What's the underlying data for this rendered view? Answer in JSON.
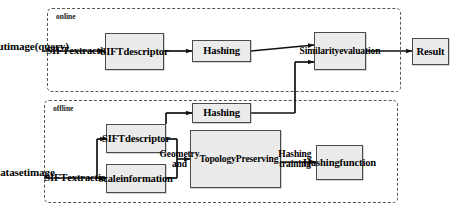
{
  "diagram": {
    "zones": [
      {
        "id": "online",
        "label": "online",
        "x": 47,
        "y": 8,
        "w": 354,
        "h": 84
      },
      {
        "id": "offline",
        "label": "offline",
        "x": 44,
        "y": 100,
        "w": 354,
        "h": 103
      }
    ],
    "nodes": [
      {
        "id": "input_image",
        "label": "Input\nimage\n(query)",
        "x": 2,
        "y": 24,
        "w": 46,
        "h": 44,
        "boxed": false,
        "fontSize": 11
      },
      {
        "id": "sift_extraction_on",
        "label": "SIFT\nextraction",
        "x": 52,
        "y": 37,
        "w": 56,
        "h": 28,
        "boxed": false,
        "fontSize": 10.5
      },
      {
        "id": "sift_descriptor_on",
        "label": "SIFT\ndescriptor",
        "x": 105,
        "y": 33,
        "w": 59,
        "h": 37,
        "boxed": true,
        "fontSize": 10.5
      },
      {
        "id": "hashing_online",
        "label": "Hashing",
        "x": 192,
        "y": 40,
        "w": 59,
        "h": 22,
        "boxed": true,
        "fontSize": 10.5
      },
      {
        "id": "similarity_eval",
        "label": "Similarity\nevaluation",
        "x": 314,
        "y": 32,
        "w": 52,
        "h": 38,
        "boxed": true,
        "fontSize": 9.5
      },
      {
        "id": "result",
        "label": "Result",
        "x": 412,
        "y": 38,
        "w": 37,
        "h": 27,
        "boxed": true,
        "fontSize": 10.5
      },
      {
        "id": "dataset_image",
        "label": "Dataset\nimage",
        "x": 1,
        "y": 156,
        "w": 45,
        "h": 32,
        "boxed": false,
        "fontSize": 11
      },
      {
        "id": "sift_extraction_off",
        "label": "SIFT\nextraction",
        "x": 50,
        "y": 164,
        "w": 56,
        "h": 28,
        "boxed": false,
        "fontSize": 10.5
      },
      {
        "id": "sift_descriptor_off",
        "label": "SIFT\ndescriptor",
        "x": 106,
        "y": 124,
        "w": 60,
        "h": 29,
        "boxed": true,
        "fontSize": 10.5
      },
      {
        "id": "scale_information",
        "label": "scale\ninformation",
        "x": 106,
        "y": 164,
        "w": 60,
        "h": 29,
        "boxed": true,
        "fontSize": 10.5
      },
      {
        "id": "hashing_offline",
        "label": "Hashing",
        "x": 192,
        "y": 103,
        "w": 59,
        "h": 20,
        "boxed": true,
        "fontSize": 10.5
      },
      {
        "id": "gtp_training",
        "label": "Geometry and\nTopology\nPreserving\nHashing training",
        "x": 190,
        "y": 130,
        "w": 91,
        "h": 58,
        "boxed": true,
        "fontSize": 9.5
      },
      {
        "id": "hashing_function",
        "label": "Hashing\nfunction",
        "x": 316,
        "y": 145,
        "w": 47,
        "h": 35,
        "boxed": true,
        "fontSize": 10.5
      }
    ],
    "edges": [
      {
        "id": "e-input-to-sift",
        "from": "input_image",
        "to": "sift_extraction_on"
      },
      {
        "id": "e-sift-to-descriptor",
        "from": "sift_extraction_on",
        "to": "sift_descriptor_on"
      },
      {
        "id": "e-descriptor-to-hash",
        "from": "sift_descriptor_on",
        "to": "hashing_online"
      },
      {
        "id": "e-hash-to-similarity",
        "from": "hashing_online",
        "to": "similarity_eval"
      },
      {
        "id": "e-similarity-to-result",
        "from": "similarity_eval",
        "to": "result"
      },
      {
        "id": "e-dataset-to-sift",
        "from": "dataset_image",
        "to": "sift_extraction_off"
      },
      {
        "id": "e-siftoff-to-descr",
        "from": "sift_extraction_off",
        "to": "sift_descriptor_off"
      },
      {
        "id": "e-siftoff-to-scale",
        "from": "sift_extraction_off",
        "to": "scale_information"
      },
      {
        "id": "e-descroff-to-hashoff",
        "from": "sift_descriptor_off",
        "to": "hashing_offline"
      },
      {
        "id": "e-descroff-to-gtp",
        "from": "sift_descriptor_off",
        "to": "gtp_training"
      },
      {
        "id": "e-scale-to-gtp",
        "from": "scale_information",
        "to": "gtp_training"
      },
      {
        "id": "e-gtp-to-hashfn",
        "from": "gtp_training",
        "to": "hashing_function"
      },
      {
        "id": "e-hashoff-to-similarity",
        "from": "hashing_offline",
        "to": "similarity_eval"
      }
    ],
    "colors": {
      "node_fill": "#ebebeb",
      "node_border": "#4a4a4a",
      "connector": "#111111",
      "zone_border": "#555555",
      "background": "#ffffff"
    }
  }
}
